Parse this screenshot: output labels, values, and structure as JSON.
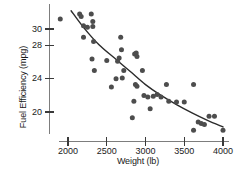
{
  "chart_data": {
    "type": "scatter",
    "title": "",
    "xlabel": "Weight (lb)",
    "ylabel": "Fuel Efficiency (mpg)",
    "xlim": [
      1820,
      4080
    ],
    "ylim": [
      17.0,
      32.2
    ],
    "xticks": [
      2000,
      2500,
      3000,
      3500,
      4000
    ],
    "xtick_labels": [
      "2000",
      "2500",
      "3000",
      "3500",
      "4000"
    ],
    "yticks": [
      20,
      24,
      28,
      30
    ],
    "ytick_labels": [
      "20",
      "24",
      "28",
      "30"
    ],
    "grid": false,
    "legend": null,
    "point_color": "#4d4d4d",
    "curve_color": "#2b2b2b",
    "axis_color": "#7d7d7d",
    "points": [
      {
        "x": 1900,
        "y": 31.2
      },
      {
        "x": 2150,
        "y": 31.8
      },
      {
        "x": 2170,
        "y": 31.5
      },
      {
        "x": 2300,
        "y": 31.8
      },
      {
        "x": 2320,
        "y": 30.9
      },
      {
        "x": 2200,
        "y": 30.4
      },
      {
        "x": 2250,
        "y": 30.2
      },
      {
        "x": 2320,
        "y": 30.3
      },
      {
        "x": 2200,
        "y": 29.0
      },
      {
        "x": 2330,
        "y": 28.5
      },
      {
        "x": 2680,
        "y": 29.0
      },
      {
        "x": 2310,
        "y": 26.4
      },
      {
        "x": 2500,
        "y": 26.2
      },
      {
        "x": 2640,
        "y": 26.1
      },
      {
        "x": 2660,
        "y": 26.5
      },
      {
        "x": 2690,
        "y": 27.5
      },
      {
        "x": 2860,
        "y": 27.0
      },
      {
        "x": 2880,
        "y": 27.1
      },
      {
        "x": 2890,
        "y": 26.7
      },
      {
        "x": 2340,
        "y": 25.0
      },
      {
        "x": 2620,
        "y": 24.0
      },
      {
        "x": 2700,
        "y": 24.1
      },
      {
        "x": 2720,
        "y": 25.0
      },
      {
        "x": 2960,
        "y": 25.0
      },
      {
        "x": 2560,
        "y": 23.0
      },
      {
        "x": 2870,
        "y": 23.3
      },
      {
        "x": 2890,
        "y": 23.1
      },
      {
        "x": 3270,
        "y": 23.3
      },
      {
        "x": 3620,
        "y": 23.3
      },
      {
        "x": 2850,
        "y": 21.3
      },
      {
        "x": 2980,
        "y": 22.0
      },
      {
        "x": 3030,
        "y": 21.8
      },
      {
        "x": 3100,
        "y": 21.9
      },
      {
        "x": 3150,
        "y": 22.1
      },
      {
        "x": 3200,
        "y": 21.8
      },
      {
        "x": 3300,
        "y": 21.3
      },
      {
        "x": 3400,
        "y": 21.2
      },
      {
        "x": 3500,
        "y": 21.2
      },
      {
        "x": 3060,
        "y": 20.4
      },
      {
        "x": 2830,
        "y": 19.3
      },
      {
        "x": 3820,
        "y": 19.5
      },
      {
        "x": 3890,
        "y": 19.5
      },
      {
        "x": 3680,
        "y": 18.8
      },
      {
        "x": 3720,
        "y": 18.6
      },
      {
        "x": 3760,
        "y": 18.5
      },
      {
        "x": 3620,
        "y": 17.8
      },
      {
        "x": 4000,
        "y": 17.8
      }
    ],
    "trend_curve": {
      "description": "smooth decreasing curve fitted through the scatter",
      "points": [
        {
          "x": 2040,
          "y": 32.2
        },
        {
          "x": 2200,
          "y": 30.2
        },
        {
          "x": 2400,
          "y": 28.1
        },
        {
          "x": 2600,
          "y": 26.5
        },
        {
          "x": 2800,
          "y": 24.9
        },
        {
          "x": 3000,
          "y": 23.3
        },
        {
          "x": 3200,
          "y": 22.0
        },
        {
          "x": 3400,
          "y": 20.9
        },
        {
          "x": 3600,
          "y": 19.9
        },
        {
          "x": 3800,
          "y": 19.0
        },
        {
          "x": 4000,
          "y": 18.2
        }
      ]
    }
  }
}
